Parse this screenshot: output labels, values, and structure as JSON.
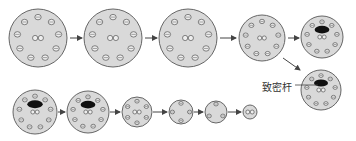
{
  "label": "致密杆",
  "colors": {
    "cell_fill": "#d9d9d9",
    "cell_stroke": "#666666",
    "doublet_fill": "#eeeeee",
    "doublet_stroke": "#555555",
    "rod": "#111111",
    "arrow": "#444444"
  },
  "stages": [
    {
      "id": 1,
      "cx": 38,
      "cy": 38,
      "r": 29,
      "outer_doublets": 9,
      "central_pair": true,
      "rod": false
    },
    {
      "id": 2,
      "cx": 113,
      "cy": 38,
      "r": 29,
      "outer_doublets": 9,
      "central_pair": true,
      "rod": false
    },
    {
      "id": 3,
      "cx": 188,
      "cy": 38,
      "r": 29,
      "outer_doublets": 9,
      "central_pair": true,
      "rod": false
    },
    {
      "id": 4,
      "cx": 262,
      "cy": 38,
      "r": 23,
      "outer_doublets": 9,
      "central_pair": true,
      "rod": false
    },
    {
      "id": 5,
      "cx": 322,
      "cy": 37,
      "r": 21,
      "outer_doublets": 9,
      "central_pair": true,
      "rod": true
    },
    {
      "id": 6,
      "cx": 321,
      "cy": 90,
      "r": 20,
      "outer_doublets": 9,
      "central_pair": true,
      "rod": true
    },
    {
      "id": 7,
      "cx": 35,
      "cy": 112,
      "r": 22,
      "outer_doublets": 9,
      "central_pair": true,
      "rod": true
    },
    {
      "id": 8,
      "cx": 88,
      "cy": 112,
      "r": 21,
      "outer_doublets": 9,
      "central_pair": true,
      "rod": true
    },
    {
      "id": 9,
      "cx": 137,
      "cy": 112,
      "r": 15,
      "outer_doublets": 6,
      "central_pair": true,
      "rod": false
    },
    {
      "id": 10,
      "cx": 181,
      "cy": 112,
      "r": 12,
      "outer_doublets": 4,
      "central_pair": false,
      "rod": false
    },
    {
      "id": 11,
      "cx": 216,
      "cy": 112,
      "r": 11,
      "outer_doublets": 3,
      "central_pair": false,
      "rod": false
    },
    {
      "id": 12,
      "cx": 250,
      "cy": 112,
      "r": 7,
      "outer_doublets": 0,
      "central_pair": true,
      "rod": false
    }
  ]
}
